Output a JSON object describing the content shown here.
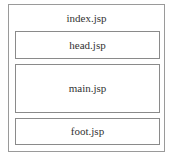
{
  "diagram": {
    "container": {
      "label": "index.jsp"
    },
    "sections": [
      {
        "id": "head",
        "label": "head.jsp"
      },
      {
        "id": "main",
        "label": "main.jsp"
      },
      {
        "id": "foot",
        "label": "foot.jsp"
      }
    ]
  }
}
